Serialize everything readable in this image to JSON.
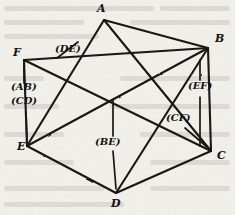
{
  "figure": {
    "kind": "hand-drawn-graph-diagram",
    "background_color": "#f3f1ec",
    "ink_color": "#1a1712",
    "vertices": [
      {
        "id": "A",
        "label": "A",
        "x": 104,
        "y": 20,
        "label_x": 97,
        "label_y": 4
      },
      {
        "id": "B",
        "label": "B",
        "x": 208,
        "y": 48,
        "label_x": 214,
        "label_y": 35
      },
      {
        "id": "C",
        "label": "C",
        "x": 211,
        "y": 151,
        "label_x": 216,
        "label_y": 150
      },
      {
        "id": "D",
        "label": "D",
        "x": 116,
        "y": 193,
        "label_x": 112,
        "label_y": 197
      },
      {
        "id": "E",
        "label": "E",
        "x": 27,
        "y": 146,
        "label_x": 19,
        "label_y": 142
      },
      {
        "id": "F",
        "label": "F",
        "x": 24,
        "y": 60,
        "label_x": 14,
        "label_y": 49
      }
    ],
    "edges": [
      {
        "from": "A",
        "to": "B"
      },
      {
        "from": "A",
        "to": "C"
      },
      {
        "from": "A",
        "to": "E"
      },
      {
        "from": "B",
        "to": "C"
      },
      {
        "from": "B",
        "to": "D"
      },
      {
        "from": "B",
        "to": "E"
      },
      {
        "from": "B",
        "to": "F"
      },
      {
        "from": "C",
        "to": "D"
      },
      {
        "from": "C",
        "to": "F"
      },
      {
        "from": "D",
        "to": "E"
      },
      {
        "from": "E",
        "to": "F"
      }
    ],
    "edge_labels": [
      {
        "id": "DE",
        "text": "(DE)",
        "x": 55,
        "y": 48,
        "struck": true,
        "leader": null
      },
      {
        "id": "AB",
        "text": "(AB)",
        "x": 12,
        "y": 86,
        "struck": false,
        "leader": {
          "x1": 24,
          "y1": 60,
          "x2": 24,
          "y2": 83
        }
      },
      {
        "id": "CD",
        "text": "(CD)",
        "x": 12,
        "y": 99,
        "struck": false,
        "leader": {
          "x1": 26,
          "y1": 112,
          "x2": 27,
          "y2": 141
        }
      },
      {
        "id": "EF",
        "text": "(EF)",
        "x": 190,
        "y": 85,
        "struck": false,
        "leader": {
          "x1": 200,
          "y1": 72,
          "x2": 200,
          "y2": 80
        }
      },
      {
        "id": "CF",
        "text": "(CF)",
        "x": 168,
        "y": 117,
        "struck": false,
        "leader": {
          "x1": 185,
          "y1": 128,
          "x2": 206,
          "y2": 146
        }
      },
      {
        "id": "BE",
        "text": "(BE)",
        "x": 96,
        "y": 141,
        "struck": false,
        "leader": {
          "x1": 113,
          "y1": 108,
          "x2": 113,
          "y2": 136
        }
      }
    ],
    "strike": {
      "x1": 57,
      "y1": 58,
      "x2": 78,
      "y2": 42
    }
  }
}
